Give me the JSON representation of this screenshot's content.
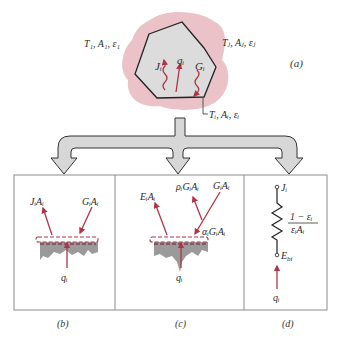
{
  "figure": {
    "panel_a": {
      "caption": "(a)",
      "surface_1_label": "T₁, A₁, ε₁",
      "surface_j_label": "Tⱼ, Aⱼ, εⱼ",
      "surface_i_label": "Tᵢ, Aᵢ, εᵢ",
      "radiosity_label": "Jᵢ",
      "net_heat_label": "qᵢ",
      "irradiation_label": "Gᵢ"
    },
    "panel_b": {
      "caption": "(b)",
      "outgoing_label": "JᵢAᵢ",
      "incoming_label": "GᵢAᵢ",
      "net_label": "qᵢ"
    },
    "panel_c": {
      "caption": "(c)",
      "emitted_label": "EᵢAᵢ",
      "reflected_label": "ρᵢGᵢAᵢ",
      "incident_label": "GᵢAᵢ",
      "absorbed_label": "αᵢGᵢAᵢ",
      "net_label": "qᵢ"
    },
    "panel_d": {
      "caption": "(d)",
      "top_node_label": "Jᵢ",
      "bottom_node_label": "E",
      "bottom_node_sub": "bi",
      "resistance_numerator": "1 − εᵢ",
      "resistance_denominator": "εᵢAᵢ",
      "net_label": "qᵢ"
    },
    "colors": {
      "arrow_red": "#b0334a",
      "surface_gray": "#9a9a9a",
      "polygon_fill": "#dcdcdc",
      "pink_halo": "#e7b7bd",
      "flow_arrow_fill": "#d7d7d7",
      "border": "#8c8c8c"
    }
  }
}
